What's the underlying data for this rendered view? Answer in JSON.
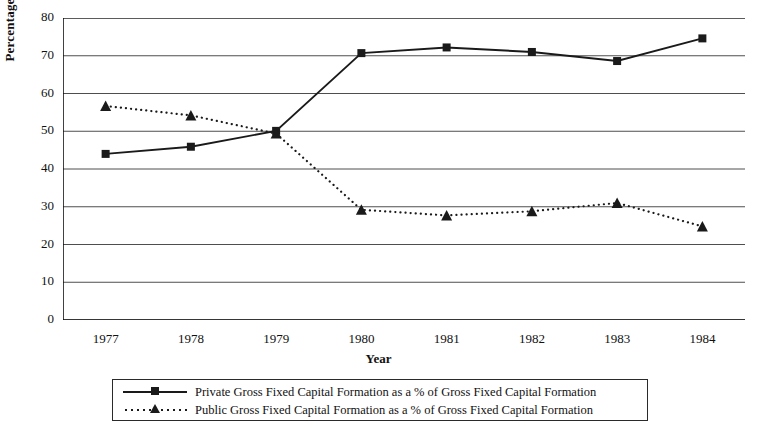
{
  "chart_data": {
    "type": "line",
    "title": "",
    "xlabel": "Year",
    "ylabel": "Percentage",
    "categories": [
      "1977",
      "1978",
      "1979",
      "1980",
      "1981",
      "1982",
      "1983",
      "1984"
    ],
    "ylim": [
      0,
      80
    ],
    "yticks": [
      0,
      10,
      20,
      30,
      40,
      50,
      60,
      70,
      80
    ],
    "grid": true,
    "legend_position": "bottom",
    "series": [
      {
        "name": "Private Gross Fixed Capital Formation as a % of Gross Fixed Capital Formation",
        "marker": "square",
        "line_style": "solid",
        "color": "#1a1a1a",
        "values": [
          44.0,
          45.9,
          50.1,
          70.7,
          72.2,
          71.0,
          68.6,
          74.6
        ]
      },
      {
        "name": "Public Gross Fixed Capital Formation as a % of Gross Fixed Capital Formation",
        "marker": "triangle",
        "line_style": "dotted",
        "color": "#1a1a1a",
        "values": [
          56.7,
          54.2,
          49.4,
          29.2,
          27.7,
          28.8,
          31.0,
          24.8
        ]
      }
    ]
  }
}
